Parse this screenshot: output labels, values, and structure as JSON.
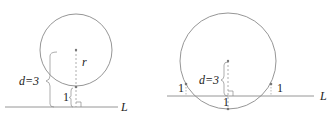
{
  "figures": [
    {
      "id": "left",
      "description": "Circle tangent-free case: distance from center to line equals 3, radius r, gap of 1 between circle and line",
      "labels": {
        "radius": "r",
        "distance": "d=3",
        "gap": "1",
        "line": "L"
      }
    },
    {
      "id": "right",
      "description": "Circle intersecting line L: distance d=3 from center, three points at distance 1 from L",
      "labels": {
        "distance": "d=3",
        "gap_left": "1",
        "gap_right": "1",
        "gap_bottom": "1",
        "line": "L"
      }
    }
  ],
  "colors": {
    "circle": "#8a8a8a",
    "line": "#8a8a8a",
    "dashed": "#9a9a9a",
    "text": "#222222",
    "point": "#777777"
  }
}
